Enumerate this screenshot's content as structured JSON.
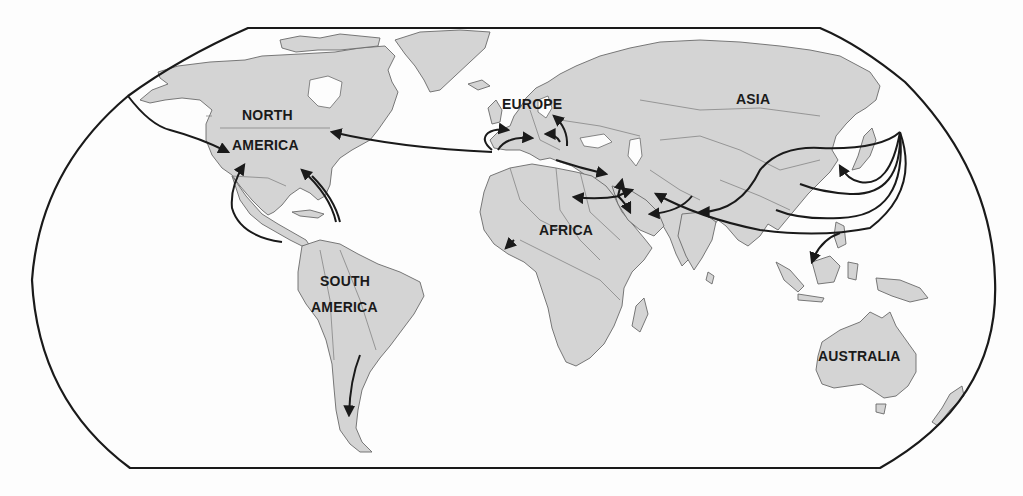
{
  "map": {
    "type": "world-map",
    "projection": "Robinson-style",
    "theme": "human migration routes",
    "colors": {
      "land": "#d4d4d4",
      "ocean": "#fdfdfd",
      "outline": "#1a1a1a",
      "routes": "#1a1a1a"
    },
    "labels": {
      "north_america_1": "NORTH",
      "north_america_2": "AMERICA",
      "south_america_1": "SOUTH",
      "south_america_2": "AMERICA",
      "europe": "EUROPE",
      "asia": "ASIA",
      "africa": "AFRICA",
      "australia": "AUSTRALIA"
    },
    "routes": [
      {
        "from": "Bering region",
        "to": "North America (west)"
      },
      {
        "from": "Western Europe",
        "to": "North America (east)"
      },
      {
        "from": "Central America",
        "to": "North America (south)"
      },
      {
        "from": "Caribbean",
        "to": "North America (south-east)"
      },
      {
        "from": "Iberia",
        "to": "Western Europe"
      },
      {
        "from": "Balkans",
        "to": "Central Europe"
      },
      {
        "from": "Mediterranean",
        "to": "Middle East"
      },
      {
        "from": "Arabia",
        "to": "North Africa"
      },
      {
        "from": "Red Sea",
        "to": "East Africa"
      },
      {
        "from": "West Africa",
        "to": "West Africa (south)"
      },
      {
        "from": "South Asia",
        "to": "Arabia"
      },
      {
        "from": "East Asia",
        "to": "Arabia"
      },
      {
        "from": "North-east Asia",
        "to": "Korea / Japan"
      },
      {
        "from": "North-east Asia",
        "to": "China"
      },
      {
        "from": "North-east Asia",
        "to": "Southeast Asia"
      },
      {
        "from": "North-east Asia",
        "to": "Indonesia"
      },
      {
        "from": "Southern South America",
        "to": "Patagonia"
      }
    ]
  }
}
